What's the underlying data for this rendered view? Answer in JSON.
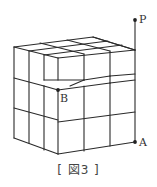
{
  "figure": {
    "caption": "[ 図3 ]",
    "points": [
      {
        "name": "P",
        "x": 135,
        "y": 20
      },
      {
        "name": "A",
        "x": 135,
        "y": 142
      },
      {
        "name": "B",
        "x": 58,
        "y": 90
      }
    ],
    "line_color": "#2a2a2a"
  }
}
